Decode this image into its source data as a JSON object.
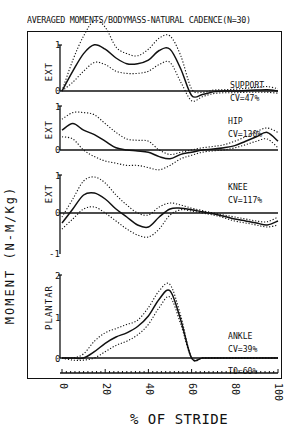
{
  "title": "AVERAGED MOMENTS/BODYMASS-NATURAL CADENCE(N=30)",
  "y_axis_label": "MOMENT (N-M/Kg)",
  "x_axis_label": "% OF STRIDE",
  "x_ticks": [
    "0",
    "20",
    "40",
    "60",
    "80",
    "100"
  ],
  "footnote": "TO=60%",
  "panels": [
    {
      "name": "SUPPORT",
      "cv": "CV=47%",
      "direction": "EXT",
      "y_ticks": [
        "1",
        "0"
      ]
    },
    {
      "name": "HIP",
      "cv": "CV=130%",
      "direction": "EXT",
      "y_ticks": [
        "1",
        "0"
      ]
    },
    {
      "name": "KNEE",
      "cv": "CV=117%",
      "direction": "EXT",
      "y_ticks": [
        "1",
        "0",
        "-1"
      ]
    },
    {
      "name": "ANKLE",
      "cv": "CV=39%",
      "direction": "PLANTAR",
      "y_ticks": [
        "2",
        "1",
        "0"
      ]
    }
  ],
  "chart_data": {
    "type": "line",
    "title": "AVERAGED MOMENTS/BODYMASS-NATURAL CADENCE(N=30)",
    "xlabel": "% OF STRIDE",
    "ylabel": "MOMENT (N-M/Kg)",
    "x": [
      0,
      5,
      10,
      15,
      20,
      25,
      30,
      35,
      40,
      45,
      50,
      55,
      60,
      65,
      70,
      75,
      80,
      85,
      90,
      95,
      100
    ],
    "xlim": [
      0,
      100
    ],
    "grid": false,
    "legend": "none (solid = mean, dotted = ±1 SD)",
    "annotations": [
      "TO=60%"
    ],
    "panels": [
      {
        "name": "SUPPORT",
        "cv": "47%",
        "ylabel": "EXT",
        "ylim": [
          0,
          1.1
        ],
        "series": [
          {
            "name": "mean",
            "values": [
              0.0,
              0.45,
              0.85,
              1.05,
              0.95,
              0.75,
              0.62,
              0.62,
              0.7,
              0.92,
              0.95,
              0.5,
              -0.1,
              -0.08,
              -0.02,
              0.0,
              0.0,
              0.01,
              0.02,
              0.03,
              0.0
            ]
          },
          {
            "name": "mean+SD",
            "values": [
              0.0,
              0.7,
              1.25,
              1.6,
              1.45,
              1.0,
              0.85,
              0.8,
              0.95,
              1.2,
              1.25,
              0.8,
              0.05,
              -0.03,
              0.02,
              0.03,
              0.04,
              0.06,
              0.08,
              0.1,
              0.05
            ]
          },
          {
            "name": "mean-SD",
            "values": [
              0.0,
              0.2,
              0.45,
              0.65,
              0.6,
              0.45,
              0.4,
              0.4,
              0.45,
              0.6,
              0.65,
              0.2,
              -0.22,
              -0.13,
              -0.06,
              -0.04,
              -0.04,
              -0.03,
              -0.03,
              -0.03,
              -0.05
            ]
          }
        ]
      },
      {
        "name": "HIP",
        "cv": "130%",
        "ylabel": "EXT",
        "ylim": [
          -0.6,
          1.0
        ],
        "series": [
          {
            "name": "mean",
            "values": [
              0.45,
              0.6,
              0.45,
              0.35,
              0.2,
              0.05,
              0.0,
              -0.02,
              -0.05,
              -0.15,
              -0.2,
              -0.1,
              -0.05,
              0.0,
              0.02,
              0.05,
              0.1,
              0.2,
              0.3,
              0.4,
              0.2
            ]
          },
          {
            "name": "mean+SD",
            "values": [
              0.7,
              0.85,
              0.85,
              0.8,
              0.6,
              0.4,
              0.25,
              0.22,
              0.2,
              0.0,
              -0.1,
              -0.05,
              0.0,
              0.05,
              0.08,
              0.12,
              0.2,
              0.3,
              0.42,
              0.5,
              0.4
            ]
          },
          {
            "name": "mean-SD",
            "values": [
              0.3,
              0.25,
              0.0,
              -0.15,
              -0.25,
              -0.3,
              -0.35,
              -0.35,
              -0.4,
              -0.45,
              -0.35,
              -0.2,
              -0.12,
              -0.05,
              -0.02,
              0.0,
              0.05,
              0.12,
              0.2,
              0.25,
              0.05
            ]
          }
        ]
      },
      {
        "name": "KNEE",
        "cv": "117%",
        "ylabel": "EXT",
        "ylim": [
          -1,
          1
        ],
        "series": [
          {
            "name": "mean",
            "values": [
              -0.25,
              0.1,
              0.45,
              0.5,
              0.35,
              0.1,
              -0.1,
              -0.3,
              -0.35,
              -0.1,
              0.1,
              0.12,
              0.08,
              0.03,
              -0.02,
              -0.08,
              -0.15,
              -0.2,
              -0.25,
              -0.3,
              -0.2
            ]
          },
          {
            "name": "mean+SD",
            "values": [
              -0.1,
              0.35,
              0.8,
              0.9,
              0.75,
              0.45,
              0.2,
              0.0,
              -0.05,
              0.15,
              0.25,
              0.2,
              0.12,
              0.06,
              0.0,
              -0.05,
              -0.1,
              -0.15,
              -0.2,
              -0.22,
              -0.1
            ]
          },
          {
            "name": "mean-SD",
            "values": [
              -0.4,
              -0.15,
              0.1,
              0.15,
              0.0,
              -0.2,
              -0.4,
              -0.55,
              -0.6,
              -0.4,
              -0.05,
              0.08,
              0.05,
              0.0,
              -0.05,
              -0.12,
              -0.2,
              -0.25,
              -0.3,
              -0.35,
              -0.3
            ]
          }
        ]
      },
      {
        "name": "ANKLE",
        "cv": "39%",
        "ylabel": "PLANTAR",
        "ylim": [
          0,
          2
        ],
        "series": [
          {
            "name": "mean",
            "values": [
              0.0,
              0.0,
              0.0,
              0.15,
              0.35,
              0.5,
              0.6,
              0.75,
              1.0,
              1.4,
              1.6,
              0.9,
              0.0,
              0.0,
              0.0,
              0.0,
              0.0,
              0.0,
              0.0,
              0.0,
              0.0
            ]
          },
          {
            "name": "mean+SD",
            "values": [
              0.0,
              0.0,
              0.1,
              0.4,
              0.6,
              0.7,
              0.8,
              0.9,
              1.2,
              1.6,
              1.75,
              1.0,
              0.0,
              0.0,
              0.0,
              0.0,
              0.0,
              0.0,
              0.0,
              0.0,
              0.0
            ]
          },
          {
            "name": "mean-SD",
            "values": [
              0.0,
              -0.05,
              -0.05,
              0.0,
              0.15,
              0.3,
              0.4,
              0.55,
              0.8,
              1.2,
              1.45,
              0.8,
              0.0,
              0.0,
              0.0,
              0.0,
              0.0,
              0.0,
              0.0,
              0.0,
              0.0
            ]
          }
        ]
      }
    ]
  }
}
